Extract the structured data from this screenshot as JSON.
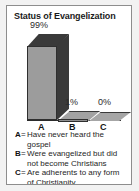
{
  "chart_data": {
    "type": "bar",
    "title": "Status of Evangelization",
    "categories": [
      "A",
      "B",
      "C"
    ],
    "values": [
      99,
      1,
      0
    ],
    "value_labels": [
      "99%",
      "1%",
      "0%"
    ],
    "xlabel": "",
    "ylabel": "",
    "ylim": [
      0,
      100
    ],
    "grid": false,
    "legend_position": "below-plot",
    "style": "3d-bar",
    "legend": [
      {
        "key": "A",
        "separator": "=",
        "description": "Have never heard the gospel"
      },
      {
        "key": "B",
        "separator": "=",
        "description": "Were evangelized but did not become Christians"
      },
      {
        "key": "C",
        "separator": "=",
        "description": "Are adherents to any form of Christianity"
      }
    ],
    "colors": {
      "bar_front": "#9c9c9c",
      "bar_shadow": "#3a3a3a",
      "outline": "#2f2f2f",
      "text": "#262626",
      "frame": "#8d8d8d",
      "background": "#ffffff"
    }
  }
}
